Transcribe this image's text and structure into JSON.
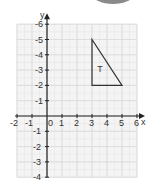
{
  "diagram": {
    "type": "coordinate-grid",
    "x_axis": {
      "label": "x",
      "min": -2,
      "max": 6,
      "ticks": [
        "-2",
        "-1",
        "0",
        "1",
        "2",
        "3",
        "4",
        "5",
        "6"
      ]
    },
    "y_axis": {
      "label": "y",
      "min": -4,
      "max": 6,
      "ticks": [
        "6",
        "5",
        "4",
        "3",
        "2",
        "1",
        "-1",
        "-2",
        "-3",
        "-4"
      ]
    },
    "shape": {
      "label": "T",
      "vertices": [
        [
          3,
          5
        ],
        [
          3,
          2
        ],
        [
          5,
          2
        ]
      ],
      "stroke": "#333333"
    },
    "colors": {
      "grid": "#dddddd",
      "grid_bg": "#f4f4f4",
      "axis": "#222222",
      "decoration": "#8a8a8a"
    }
  }
}
